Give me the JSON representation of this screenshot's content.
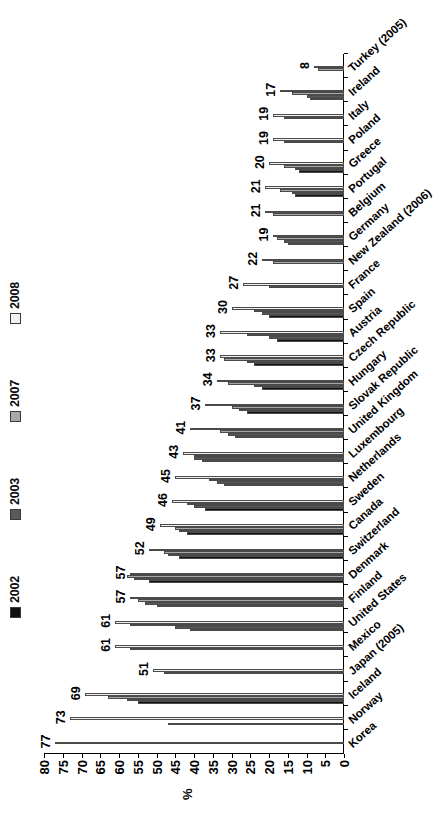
{
  "chart_data": {
    "type": "bar",
    "title": "",
    "xlabel": "",
    "ylabel": "%",
    "ylim": [
      0,
      80
    ],
    "yticks": [
      80,
      75,
      70,
      65,
      60,
      55,
      50,
      45,
      40,
      35,
      30,
      25,
      20,
      15,
      10,
      5,
      0
    ],
    "grid": false,
    "legend_position": "top",
    "orientation": "vertical-bars-rotated",
    "categories": [
      "Korea",
      "Norway",
      "Iceland",
      "Japan (2005)",
      "Mexico",
      "United States",
      "Finland",
      "Denmark",
      "Switzerland",
      "Canada",
      "Sweden",
      "Netherlands",
      "Luxembourg",
      "United Kingdom",
      "Slovak Republic",
      "Hungary",
      "Czech Republic",
      "Austria",
      "Spain",
      "France",
      "New Zealand (2006)",
      "Germany",
      "Belgium",
      "Portugal",
      "Greece",
      "Poland",
      "Italy",
      "Ireland",
      "Turkey (2005)"
    ],
    "series": [
      {
        "name": "2002",
        "color": "#111111",
        "values": [
          null,
          null,
          55,
          null,
          null,
          41,
          50,
          52,
          44,
          42,
          37,
          32,
          38,
          29,
          26,
          22,
          24,
          18,
          20,
          null,
          null,
          15,
          null,
          13,
          12,
          null,
          null,
          9,
          null
        ]
      },
      {
        "name": "2003",
        "color": "#595959",
        "values": [
          null,
          47,
          58,
          null,
          null,
          45,
          53,
          56,
          47,
          44,
          40,
          34,
          40,
          31,
          28,
          24,
          26,
          20,
          22,
          null,
          null,
          16,
          null,
          14,
          13,
          null,
          null,
          10,
          null
        ]
      },
      {
        "name": "2007",
        "color": "#a8a8a8",
        "values": [
          null,
          null,
          63,
          48,
          57,
          57,
          55,
          58,
          48,
          45,
          42,
          36,
          40,
          33,
          30,
          31,
          32,
          26,
          24,
          20,
          19,
          18,
          19,
          17,
          16,
          16,
          16,
          14,
          7
        ]
      },
      {
        "name": "2008",
        "color": "#f1f1f1",
        "values": [
          77,
          73,
          69,
          51,
          61,
          61,
          57,
          57,
          52,
          49,
          46,
          45,
          43,
          41,
          37,
          34,
          33,
          33,
          30,
          27,
          22,
          19,
          21,
          21,
          20,
          19,
          19,
          17,
          8
        ]
      }
    ],
    "data_labels": [
      77,
      73,
      69,
      51,
      61,
      61,
      57,
      57,
      52,
      49,
      46,
      45,
      43,
      41,
      37,
      34,
      33,
      33,
      30,
      27,
      22,
      19,
      21,
      21,
      20,
      19,
      19,
      17,
      8
    ]
  },
  "legend": {
    "items": [
      {
        "label": "2002",
        "color": "#111111"
      },
      {
        "label": "2003",
        "color": "#595959"
      },
      {
        "label": "2007",
        "color": "#a8a8a8"
      },
      {
        "label": "2008",
        "color": "#f1f1f1"
      }
    ]
  },
  "axis": {
    "value_axis_title": "%"
  }
}
